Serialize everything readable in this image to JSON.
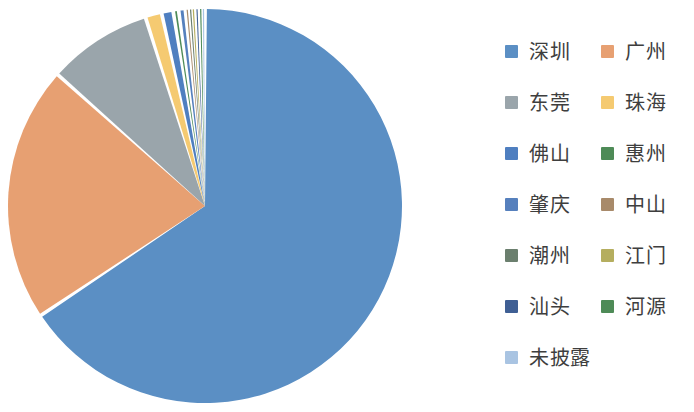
{
  "chart_data": {
    "type": "pie",
    "title": "",
    "subtitle": "",
    "xlabel": "",
    "ylabel": "",
    "legend_position": "right",
    "grid": false,
    "start_angle_deg": 0,
    "direction": "clockwise",
    "labels": [
      "深圳",
      "广州",
      "东莞",
      "珠海",
      "佛山",
      "惠州",
      "肇庆",
      "中山",
      "潮州",
      "江门",
      "汕头",
      "河源",
      "未披露"
    ],
    "values": [
      66.1,
      21.1,
      8.6,
      1.35,
      0.95,
      0.45,
      0.55,
      0.3,
      0.25,
      0.2,
      0.4,
      0.2,
      0.25
    ],
    "colors": [
      "#5b8fc4",
      "#e7a072",
      "#9aa5ab",
      "#f5ca71",
      "#4f7fc0",
      "#4e8b57",
      "#5680bd",
      "#a88a6a",
      "#6b7f6e",
      "#b5ae5f",
      "#3f5f94",
      "#4e8b57",
      "#a9c4e2"
    ],
    "slices": [
      {
        "label": "深圳",
        "value": 66.1,
        "color": "#5b8fc4"
      },
      {
        "label": "广州",
        "value": 21.1,
        "color": "#e7a072"
      },
      {
        "label": "东莞",
        "value": 8.6,
        "color": "#9aa5ab"
      },
      {
        "label": "珠海",
        "value": 1.35,
        "color": "#f5ca71"
      },
      {
        "label": "佛山",
        "value": 0.95,
        "color": "#4f7fc0"
      },
      {
        "label": "惠州",
        "value": 0.45,
        "color": "#4e8b57"
      },
      {
        "label": "肇庆",
        "value": 0.55,
        "color": "#5680bd"
      },
      {
        "label": "中山",
        "value": 0.3,
        "color": "#a88a6a"
      },
      {
        "label": "潮州",
        "value": 0.25,
        "color": "#6b7f6e"
      },
      {
        "label": "江门",
        "value": 0.2,
        "color": "#b5ae5f"
      },
      {
        "label": "汕头",
        "value": 0.4,
        "color": "#3f5f94"
      },
      {
        "label": "河源",
        "value": 0.2,
        "color": "#4e8b57"
      },
      {
        "label": "未披露",
        "value": 0.25,
        "color": "#a9c4e2"
      }
    ]
  },
  "legend": {
    "rows": [
      [
        {
          "label": "深圳",
          "color": "#5b8fc4"
        },
        {
          "label": "广州",
          "color": "#e7a072"
        }
      ],
      [
        {
          "label": "东莞",
          "color": "#9aa5ab"
        },
        {
          "label": "珠海",
          "color": "#f5ca71"
        }
      ],
      [
        {
          "label": "佛山",
          "color": "#4f7fc0"
        },
        {
          "label": "惠州",
          "color": "#4e8b57"
        }
      ],
      [
        {
          "label": "肇庆",
          "color": "#5680bd"
        },
        {
          "label": "中山",
          "color": "#a88a6a"
        }
      ],
      [
        {
          "label": "潮州",
          "color": "#6b7f6e"
        },
        {
          "label": "江门",
          "color": "#b5ae5f"
        }
      ],
      [
        {
          "label": "汕头",
          "color": "#3f5f94"
        },
        {
          "label": "河源",
          "color": "#4e8b57"
        }
      ],
      [
        {
          "label": "未披露",
          "color": "#a9c4e2"
        },
        null
      ]
    ]
  },
  "pie_geometry": {
    "cx": 205,
    "cy": 206,
    "r": 197,
    "gap_deg": 1.1
  }
}
